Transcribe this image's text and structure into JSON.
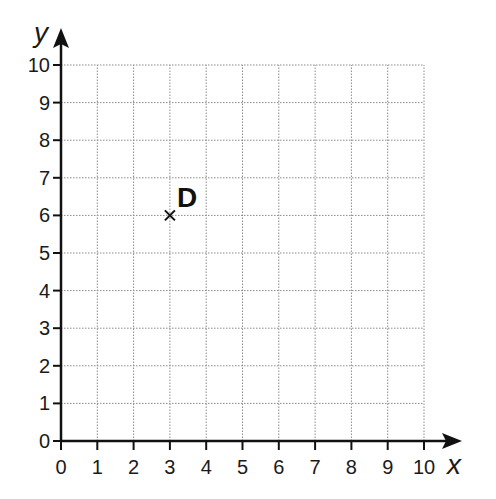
{
  "chart_data": {
    "type": "scatter",
    "title": "",
    "xlabel": "x",
    "ylabel": "y",
    "xlim": [
      0,
      10
    ],
    "ylim": [
      0,
      10
    ],
    "grid": true,
    "x_ticks": [
      "0",
      "1",
      "2",
      "3",
      "4",
      "5",
      "6",
      "7",
      "8",
      "9",
      "10"
    ],
    "y_ticks": [
      "0",
      "1",
      "2",
      "3",
      "4",
      "5",
      "6",
      "7",
      "8",
      "9",
      "10"
    ],
    "points": [
      {
        "label": "D",
        "x": 3,
        "y": 6,
        "marker": "x"
      }
    ]
  },
  "layout": {
    "origin_px": [
      61,
      441
    ],
    "unit_x_px": 36.3,
    "unit_y_px": 37.6
  }
}
